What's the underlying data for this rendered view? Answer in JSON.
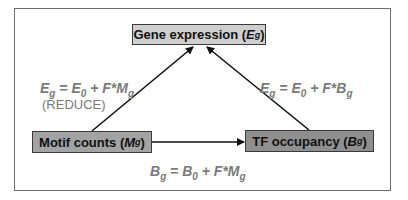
{
  "diagram": {
    "nodes": {
      "gene": {
        "label": "Gene expression (",
        "var": "E",
        "sub": "g",
        "close": ")"
      },
      "motif": {
        "label": "Motif counts (",
        "var": "M",
        "sub": "g",
        "close": ")"
      },
      "tf": {
        "label": "TF occupancy (",
        "var": "B",
        "sub": "g",
        "close": ")"
      }
    },
    "equations": {
      "left": {
        "lhs": "E",
        "lhs_sub": "g",
        "eq": " = ",
        "t1": "E",
        "t1_sub": "0",
        "plus": " + F*",
        "t2": "M",
        "t2_sub": "g"
      },
      "left_note": "(REDUCE)",
      "right": {
        "lhs": "E",
        "lhs_sub": "g",
        "eq": " = ",
        "t1": "E",
        "t1_sub": "0",
        "plus": " + F*",
        "t2": "B",
        "t2_sub": "g"
      },
      "bottom": {
        "lhs": "B",
        "lhs_sub": "g",
        "eq": " = ",
        "t1": "B",
        "t1_sub": "0",
        "plus": " + F*",
        "t2": "M",
        "t2_sub": "g"
      }
    },
    "edges": [
      {
        "from": "motif",
        "to": "gene"
      },
      {
        "from": "tf",
        "to": "gene"
      },
      {
        "from": "motif",
        "to": "tf"
      }
    ],
    "colors": {
      "gene_box": "#cfcfcf",
      "motif_box": "#a3a3a3",
      "tf_box": "#8f8f8f",
      "equation_text": "#7a7a7a"
    }
  }
}
